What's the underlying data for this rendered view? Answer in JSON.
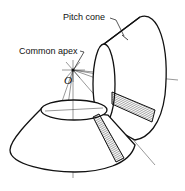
{
  "diagram": {
    "labels": {
      "pitch_cone": "Pitch cone",
      "common_apex": "Common apex",
      "apex_point": "O"
    },
    "colors": {
      "stroke": "#111111",
      "background": "#ffffff",
      "hatch": "#222222"
    },
    "elements": [
      "upper-pitch-cone",
      "lower-pitch-cone",
      "common-apex-point",
      "hatched-tooth-sections",
      "axis-center-lines"
    ]
  }
}
